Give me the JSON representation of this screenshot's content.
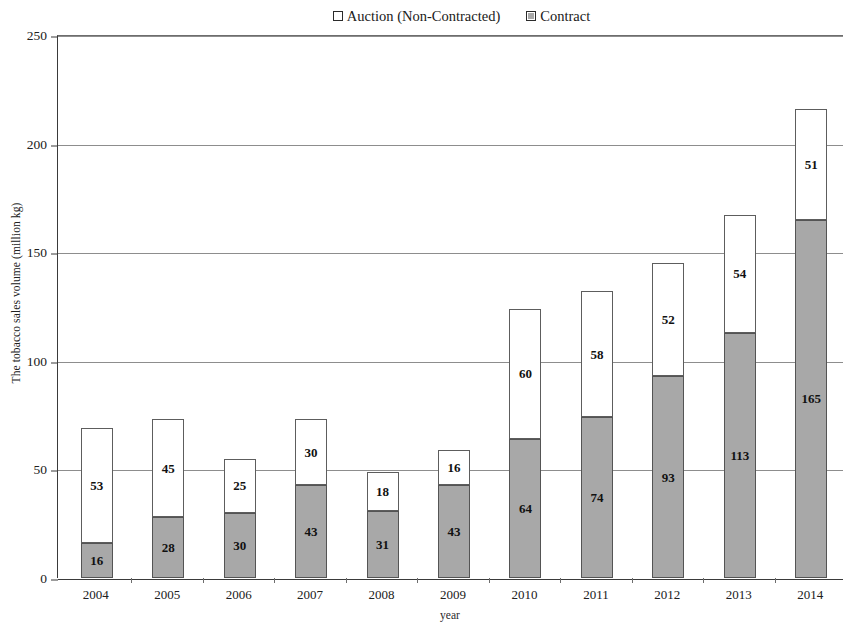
{
  "chart_data": {
    "type": "bar",
    "subtype": "stacked-column",
    "title": "",
    "xlabel": "year",
    "ylabel": "The tobacco sales volume (million kg)",
    "categories": [
      "2004",
      "2005",
      "2006",
      "2007",
      "2008",
      "2009",
      "2010",
      "2011",
      "2012",
      "2013",
      "2014"
    ],
    "series": [
      {
        "name": "Contract",
        "color": "#a8a8a8",
        "values": [
          16,
          28,
          30,
          43,
          31,
          43,
          64,
          74,
          93,
          113,
          165
        ]
      },
      {
        "name": "Auction (Non-Contracted)",
        "color": "#ffffff",
        "values": [
          53,
          45,
          25,
          30,
          18,
          16,
          60,
          58,
          52,
          54,
          51
        ]
      }
    ],
    "totals": [
      69,
      73,
      55,
      73,
      49,
      59,
      124,
      132,
      145,
      167,
      216
    ],
    "ylim": [
      0,
      250
    ],
    "yticks": [
      0,
      50,
      100,
      150,
      200,
      250
    ],
    "ytick_labels": [
      "0",
      "50",
      "100",
      "150",
      "200",
      "250"
    ],
    "grid": true,
    "legend_position": "top-right",
    "legend": [
      {
        "label": "Auction (Non-Contracted)",
        "swatch": "auction"
      },
      {
        "label": "Contract",
        "swatch": "contract"
      }
    ]
  }
}
